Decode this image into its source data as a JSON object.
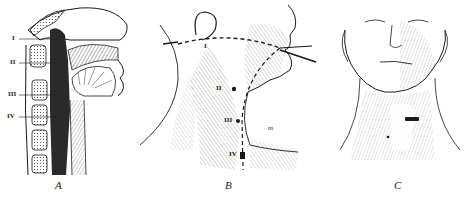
{
  "figure": {
    "panels": [
      {
        "id": "A",
        "caption": "A",
        "description": "Sagittal section of head and neck showing pharynx and cervical vertebrae",
        "labels": [
          "I",
          "II",
          "III",
          "IV"
        ]
      },
      {
        "id": "B",
        "caption": "B",
        "description": "Lateral view of neck with dashed guide lines from ear to mouth and down the neck",
        "labels": [
          "I",
          "II",
          "III",
          "IV",
          "m"
        ]
      },
      {
        "id": "C",
        "caption": "C",
        "description": "Frontal view of face and neck with incision mark on throat",
        "labels": []
      }
    ],
    "colors": {
      "ink": "#1a1a1a",
      "background": "#ffffff",
      "hatch": "#555555"
    }
  }
}
